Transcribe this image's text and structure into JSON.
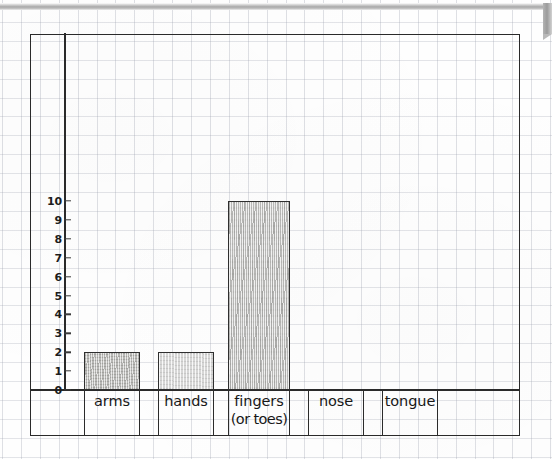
{
  "document": {
    "kind": "scanned-graph-paper-worksheet",
    "medium": "pencil on graph paper"
  },
  "chart_data": {
    "type": "bar",
    "title": "",
    "subtitle": "",
    "xlabel": "",
    "ylabel": "",
    "categories": [
      "arms",
      "hands",
      "fingers (or toes)",
      "nose",
      "tongue"
    ],
    "values": [
      2,
      2,
      10,
      0,
      0
    ],
    "ylim": [
      0,
      10
    ],
    "y_ticks": [
      "0",
      "1",
      "2",
      "3",
      "4",
      "5",
      "6",
      "7",
      "8",
      "9",
      "10"
    ],
    "grid": true,
    "legend": null,
    "annotations": [],
    "series": [
      {
        "name": "count",
        "values": [
          2,
          2,
          10,
          0,
          0
        ]
      }
    ],
    "category_labels_multiline": [
      [
        "arms"
      ],
      [
        "hands"
      ],
      [
        "fingers",
        "(or toes)"
      ],
      [
        "nose"
      ],
      [
        "tongue"
      ]
    ],
    "bar_shading": [
      "dark",
      "light",
      "dark",
      "none",
      "none"
    ]
  },
  "axis": {
    "y_ticks": [
      {
        "label": "10",
        "value": 10
      },
      {
        "label": "9",
        "value": 9
      },
      {
        "label": "8",
        "value": 8
      },
      {
        "label": "7",
        "value": 7
      },
      {
        "label": "6",
        "value": 6
      },
      {
        "label": "5",
        "value": 5
      },
      {
        "label": "4",
        "value": 4
      },
      {
        "label": "3",
        "value": 3
      },
      {
        "label": "2",
        "value": 2
      },
      {
        "label": "1",
        "value": 1
      },
      {
        "label": "0",
        "value": 0
      }
    ]
  },
  "categories": [
    {
      "id": "arms",
      "line1": "arms",
      "line2": "",
      "value": 2
    },
    {
      "id": "hands",
      "line1": "hands",
      "line2": "",
      "value": 2
    },
    {
      "id": "fingers",
      "line1": "fingers",
      "line2": "(or toes)",
      "value": 10
    },
    {
      "id": "nose",
      "line1": "nose",
      "line2": "",
      "value": 0
    },
    {
      "id": "tongue",
      "line1": "tongue",
      "line2": "",
      "value": 0
    }
  ],
  "colors": {
    "ink": "#2b2b2b",
    "grid": "#9aa0ae",
    "bar_dark": "#c4c4c0",
    "bar_light": "#dedede",
    "paper": "#fefefe",
    "scan_chrome": "#a8a8a8"
  }
}
